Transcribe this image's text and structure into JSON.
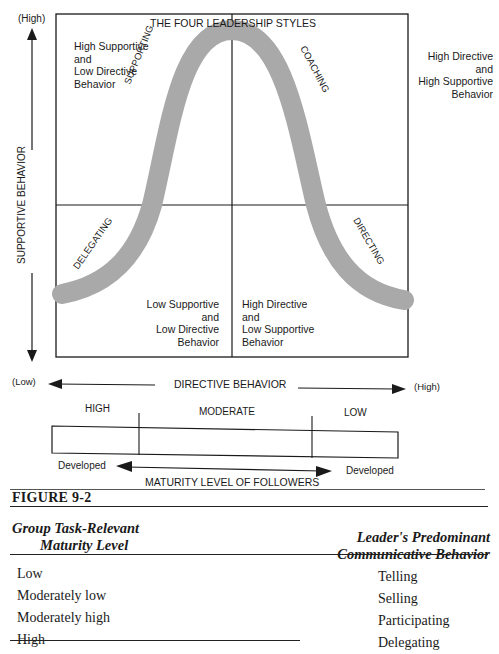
{
  "figure": {
    "title": "THE FOUR LEADERSHIP STYLES",
    "y_axis": {
      "label": "SUPPORTIVE BEHAVIOR",
      "high": "(High)",
      "low": "(Low)"
    },
    "x_axis": {
      "label": "DIRECTIVE BEHAVIOR",
      "low": "(Low)",
      "high": "(High)"
    },
    "quadrants": {
      "top_left": [
        "High Supportive",
        "and",
        "Low Directive",
        "Behavior"
      ],
      "top_right": [
        "High Directive",
        "and",
        "High Supportive",
        "Behavior"
      ],
      "bottom_left": [
        "Low Supportive",
        "and",
        "Low Directive",
        "Behavior"
      ],
      "bottom_right": [
        "High Directive",
        "and",
        "Low Supportive",
        "Behavior"
      ]
    },
    "curve_labels": {
      "supporting": "SUPPORTING",
      "coaching": "COACHING",
      "delegating": "DELEGATING",
      "directing": "DIRECTING"
    },
    "maturity_scale": {
      "segments": [
        "HIGH",
        "MODERATE",
        "LOW"
      ],
      "left_end": "Developed",
      "right_end": "Developed",
      "label": "MATURITY LEVEL OF FOLLOWERS"
    },
    "caption": "FIGURE 9-2",
    "colors": {
      "curve": "#a9a9a9",
      "lines": "#1a1a1a"
    }
  },
  "table": {
    "headers": {
      "left": [
        "Group Task-Relevant",
        "Maturity Level"
      ],
      "right": [
        "Leader's Predominant",
        "Communicative Behavior"
      ]
    },
    "rows": [
      {
        "maturity": "Low",
        "behavior": "Telling"
      },
      {
        "maturity": "Moderately low",
        "behavior": "Selling"
      },
      {
        "maturity": "Moderately high",
        "behavior": "Participating"
      },
      {
        "maturity": "High",
        "behavior": "Delegating"
      }
    ]
  }
}
